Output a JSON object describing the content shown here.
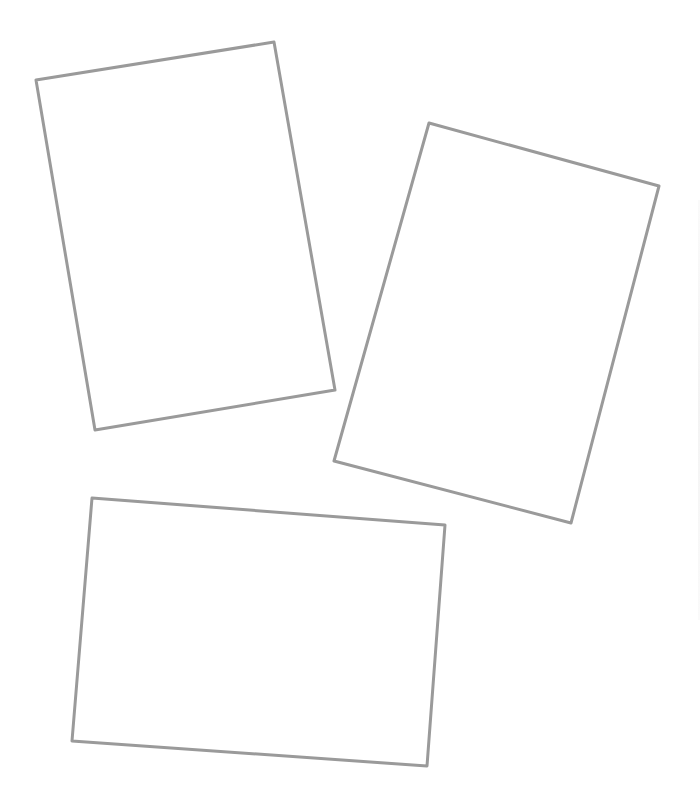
{
  "canvas": {
    "width": 700,
    "height": 802,
    "background": "#ffffff"
  },
  "style": {
    "stroke": "#9a9a9a",
    "stroke_width": 3,
    "fill": "#ffffff"
  },
  "frames": [
    {
      "name": "frame-top-left",
      "points": "36,80 274,42 335,390 95,430"
    },
    {
      "name": "frame-right",
      "points": "429,123 659,186 571,523 334,461"
    },
    {
      "name": "frame-bottom",
      "points": "92,498 445,525 427,766 72,741"
    }
  ]
}
